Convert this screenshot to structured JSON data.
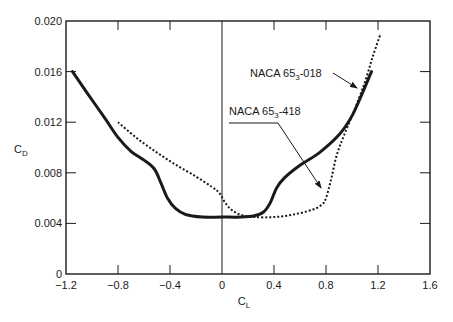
{
  "chart_data": {
    "type": "line",
    "title": "",
    "xlabel": "C_L",
    "ylabel": "C_D",
    "xlabel_main": "C",
    "xlabel_sub": "L",
    "ylabel_main": "C",
    "ylabel_sub": "D",
    "xlim": [
      -1.2,
      1.6
    ],
    "ylim": [
      0,
      0.02
    ],
    "grid": false,
    "x_ticks": [
      -1.2,
      -0.8,
      -0.4,
      0,
      0.4,
      0.8,
      1.2,
      1.6
    ],
    "x_tick_labels": [
      "−1.2",
      "−0.8",
      "−0.4",
      "0",
      "0.4",
      "0.8",
      "1.2",
      "1.6"
    ],
    "y_ticks": [
      0,
      0.004,
      0.008,
      0.012,
      0.016,
      0.02
    ],
    "y_tick_labels": [
      "0",
      "0.004",
      "0.008",
      "0.012",
      "0.016",
      "0.020"
    ],
    "legend": "annotations with arrows",
    "series": [
      {
        "name": "NACA 65_3-018",
        "label_main": "NACA 65",
        "label_sub": "3",
        "label_tail": "-018",
        "style": "solid",
        "points": [
          [
            -1.15,
            0.016
          ],
          [
            -1.05,
            0.0145
          ],
          [
            -0.9,
            0.0123
          ],
          [
            -0.8,
            0.0108
          ],
          [
            -0.7,
            0.0097
          ],
          [
            -0.6,
            0.009
          ],
          [
            -0.52,
            0.0083
          ],
          [
            -0.47,
            0.0072
          ],
          [
            -0.42,
            0.006
          ],
          [
            -0.36,
            0.0052
          ],
          [
            -0.28,
            0.0047
          ],
          [
            -0.15,
            0.0045
          ],
          [
            0.0,
            0.0045
          ],
          [
            0.15,
            0.0045
          ],
          [
            0.25,
            0.0046
          ],
          [
            0.32,
            0.0049
          ],
          [
            0.37,
            0.0056
          ],
          [
            0.42,
            0.0068
          ],
          [
            0.48,
            0.0076
          ],
          [
            0.6,
            0.0086
          ],
          [
            0.75,
            0.0096
          ],
          [
            0.9,
            0.011
          ],
          [
            1.0,
            0.0125
          ],
          [
            1.08,
            0.0143
          ],
          [
            1.15,
            0.016
          ]
        ]
      },
      {
        "name": "NACA 65_3-418",
        "label_main": "NACA 65",
        "label_sub": "3",
        "label_tail": "-418",
        "style": "dotted",
        "points": [
          [
            -0.8,
            0.012
          ],
          [
            -0.65,
            0.0107
          ],
          [
            -0.5,
            0.0096
          ],
          [
            -0.35,
            0.0086
          ],
          [
            -0.2,
            0.0077
          ],
          [
            -0.08,
            0.0069
          ],
          [
            -0.02,
            0.0064
          ],
          [
            0.02,
            0.0057
          ],
          [
            0.07,
            0.0051
          ],
          [
            0.14,
            0.0047
          ],
          [
            0.25,
            0.0045
          ],
          [
            0.4,
            0.0045
          ],
          [
            0.55,
            0.0047
          ],
          [
            0.7,
            0.0051
          ],
          [
            0.77,
            0.0055
          ],
          [
            0.8,
            0.006
          ],
          [
            0.84,
            0.0075
          ],
          [
            0.88,
            0.0093
          ],
          [
            0.94,
            0.011
          ],
          [
            1.02,
            0.013
          ],
          [
            1.1,
            0.0152
          ],
          [
            1.16,
            0.0172
          ],
          [
            1.22,
            0.019
          ]
        ]
      }
    ],
    "annotations": [
      {
        "text": "NACA 65_3-018",
        "text_pos": [
          0.45,
          0.015
        ],
        "arrow_to": [
          1.1,
          0.0138
        ]
      },
      {
        "text": "NACA 65_3-418",
        "text_pos": [
          0.06,
          0.012
        ],
        "arrow_to": [
          0.79,
          0.0063
        ]
      }
    ]
  }
}
